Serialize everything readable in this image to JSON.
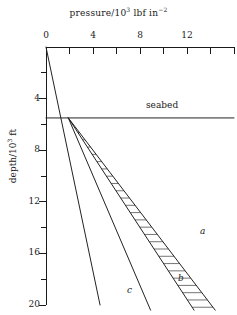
{
  "chart_data": {
    "type": "line",
    "xlabel": "pressure/10³ lbf in⁻²",
    "ylabel": "depth/10³ ft",
    "xlim": [
      0,
      16
    ],
    "ylim": [
      0,
      20
    ],
    "y_axis_inverted": true,
    "grid": false,
    "legend_position": "inline-end-labels",
    "x_ticks_major": [
      0,
      4,
      8,
      12
    ],
    "x_ticks_major_labels": [
      "0",
      "4",
      "8",
      "12"
    ],
    "x_ticks_minor": [
      2,
      6,
      10,
      14,
      16
    ],
    "y_ticks_major": [
      4,
      8,
      12,
      16,
      20
    ],
    "y_ticks_major_labels": [
      "4",
      "8",
      "12",
      "16",
      "20"
    ],
    "y_ticks_minor": [
      2,
      6,
      10,
      14,
      18
    ],
    "annotations": [
      {
        "text": "seabed",
        "x": 11.0,
        "y": 4.6
      },
      {
        "text": "a",
        "x": 13.3,
        "y": 14.3
      },
      {
        "text": "b",
        "x": 11.5,
        "y": 18.2
      },
      {
        "text": "c",
        "x": 7.2,
        "y": 19.0
      }
    ],
    "series": [
      {
        "name": "hydrostatic-water-gradient",
        "style": "solid",
        "points": [
          [
            0,
            0
          ],
          [
            4.6,
            20.0
          ]
        ]
      },
      {
        "name": "seabed-line",
        "style": "solid-horizontal",
        "points": [
          [
            0,
            5.5
          ],
          [
            16.0,
            5.5
          ]
        ]
      },
      {
        "name": "a",
        "label": "a",
        "style": "solid",
        "points": [
          [
            1.9,
            5.5
          ],
          [
            14.4,
            20.4
          ]
        ]
      },
      {
        "name": "b",
        "label": "b",
        "style": "solid",
        "points": [
          [
            1.9,
            5.5
          ],
          [
            12.6,
            20.4
          ]
        ]
      },
      {
        "name": "c",
        "label": "c",
        "style": "solid",
        "points": [
          [
            1.9,
            5.5
          ],
          [
            8.9,
            20.4
          ]
        ]
      }
    ],
    "hatched_band": {
      "name": "pressure-uncertainty-band",
      "between": [
        "a",
        "b"
      ],
      "hatch": "perpendicular-ruling"
    }
  },
  "axes": {
    "title_prefix": "pressure/10",
    "title_exp1": "3",
    "title_mid": " lbf in",
    "title_exp2": "−₂",
    "y_title_prefix": "depth/10",
    "y_title_exp": "3",
    "y_title_suffix": " ft"
  },
  "labels": {
    "seabed": "seabed",
    "a": "a",
    "b": "b",
    "c": "c",
    "x0": "0",
    "x4": "4",
    "x8": "8",
    "x12": "12",
    "y4": "4",
    "y8": "8",
    "y12": "12",
    "y16": "16",
    "y20": "20"
  },
  "colors": {
    "ink": "#1a1a1a",
    "line": "#2b2b2b",
    "hatch": "#3a3a3a",
    "background": "#ffffff"
  }
}
